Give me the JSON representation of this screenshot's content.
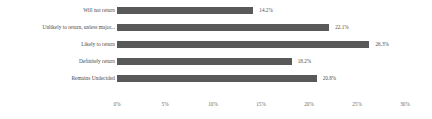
{
  "chart_data": {
    "type": "bar",
    "orientation": "horizontal",
    "title": "",
    "xlabel": "",
    "ylabel": "",
    "categories": [
      "Will not return",
      "Unlikely to return, unless major...",
      "Likely to return",
      "Definitely return",
      "Remains Undecided"
    ],
    "values": [
      14.2,
      22.1,
      26.3,
      18.2,
      20.8
    ],
    "value_labels": [
      "14.2%",
      "22.1%",
      "26.3%",
      "18.2%",
      "20.8%"
    ],
    "xlim": [
      0,
      30
    ],
    "xticks": [
      0,
      5,
      10,
      15,
      20,
      25,
      30
    ],
    "xtick_labels": [
      "0%",
      "5%",
      "10%",
      "15%",
      "20%",
      "25%",
      "30%"
    ],
    "grid": false,
    "legend": "none",
    "bar_color": "#595959",
    "text_color": "#4d4d4d",
    "background": "#ffffff"
  }
}
